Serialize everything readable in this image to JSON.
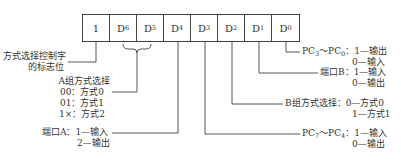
{
  "register": {
    "cells": [
      {
        "base": "1",
        "sub": ""
      },
      {
        "base": "D",
        "sub": "6"
      },
      {
        "base": "D",
        "sub": "5"
      },
      {
        "base": "D",
        "sub": "4"
      },
      {
        "base": "D",
        "sub": "3"
      },
      {
        "base": "D",
        "sub": "2"
      },
      {
        "base": "D",
        "sub": "1"
      },
      {
        "base": "D",
        "sub": "0"
      }
    ]
  },
  "annotations": {
    "flag": {
      "line1": "方式选择控制字",
      "line2": "的标志位"
    },
    "group_a": {
      "title": "A组方式选择",
      "options": [
        "00：方式0",
        "01：方式1",
        "1×：方式2"
      ]
    },
    "port_a": {
      "label": "端口A：",
      "opt1": "1—输入",
      "opt2": "2—输出"
    },
    "pc_low": {
      "label_pre": "PC",
      "sub1": "3",
      "mid": "～PC",
      "sub2": "0",
      "colon": "：",
      "opt1": "1—输出",
      "opt2": "0—输入"
    },
    "port_b": {
      "label": "端口B：",
      "opt1": "1—输入",
      "opt2": "0—输出"
    },
    "group_b": {
      "label": "B组方式选择：",
      "opt1": "0—方式0",
      "opt2": "1—方式1"
    },
    "pc_high": {
      "label_pre": "PC",
      "sub1": "7",
      "mid": "～PC",
      "sub2": "4",
      "colon": "：",
      "opt1": "1—输入",
      "opt2": "0—输出"
    }
  },
  "colors": {
    "line": "#555555",
    "text": "#333333",
    "border": "#444444"
  }
}
